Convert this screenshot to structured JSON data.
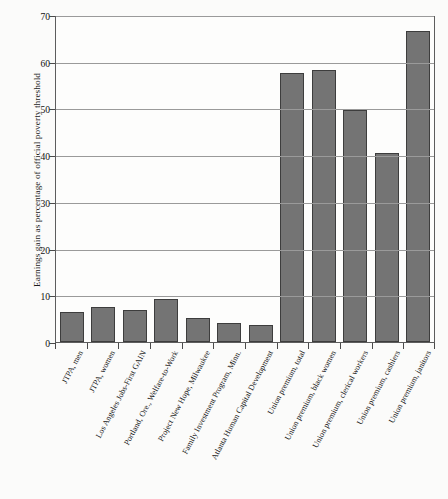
{
  "chart_data": {
    "type": "bar",
    "title": "",
    "subtitle": "",
    "xlabel": "",
    "ylabel": "Earnings gain as percentage of official poverty threshold",
    "ylim": [
      0,
      70
    ],
    "yticks": [
      0,
      10,
      20,
      30,
      40,
      50,
      60,
      70
    ],
    "grid": true,
    "legend": null,
    "bar_color": "#747474",
    "bar_edge_color": "#3d3d3d",
    "background_color": "#fdfdfc",
    "categories": [
      "JTPA, men",
      "JTPA, women",
      "Los Angeles Jobs-First GAIN",
      "Portland, Ore., Welfare-to-Work",
      "Project New Hope, Milwaukee",
      "Family Investment Program, Minn.",
      "Atlanta Human Capital Development",
      "Union premium, total",
      "Union premium, black women",
      "Union premium, clerical workers",
      "Union premium, cashiers",
      "Union premium, janitors"
    ],
    "values": [
      6.4,
      7.5,
      6.9,
      9.2,
      5.1,
      4.1,
      3.6,
      57.5,
      58.2,
      49.6,
      40.4,
      66.5
    ]
  }
}
